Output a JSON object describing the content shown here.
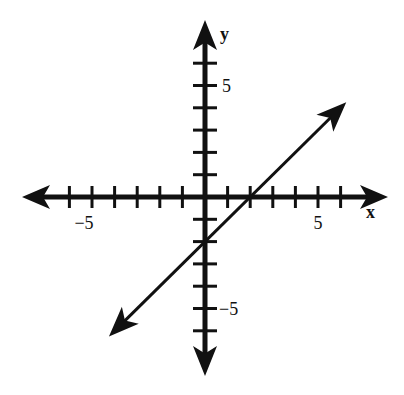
{
  "chart_data": {
    "type": "line",
    "title": "",
    "xlabel": "x",
    "ylabel": "y",
    "xlim": [
      -7,
      7
    ],
    "ylim": [
      -7,
      7
    ],
    "grid": false,
    "legend": null,
    "x_ticks": [
      -6,
      -5,
      -4,
      -3,
      -2,
      -1,
      1,
      2,
      3,
      4,
      5,
      6
    ],
    "y_ticks": [
      -6,
      -5,
      -4,
      -3,
      -2,
      -1,
      1,
      2,
      3,
      4,
      5,
      6
    ],
    "x_tick_labels": [
      {
        "value": -5,
        "label": "−5"
      },
      {
        "value": 5,
        "label": "5"
      }
    ],
    "y_tick_labels": [
      {
        "value": 5,
        "label": "5"
      },
      {
        "value": -5,
        "label": "−5"
      }
    ],
    "series": [
      {
        "name": "line",
        "equation": "y = x - 2",
        "slope": 1,
        "y_intercept": -2,
        "x_intercept": 2,
        "x": [
          -4,
          6
        ],
        "y": [
          -6,
          4
        ],
        "arrows_both_ends": true
      }
    ],
    "axes_arrows_both_ends": true
  },
  "colors": {
    "ink": "#111111",
    "background": "#ffffff"
  }
}
